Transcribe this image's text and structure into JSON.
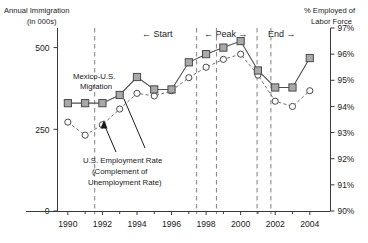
{
  "chart_data": {
    "type": "line",
    "title": "",
    "xlabel": "",
    "x": [
      1990,
      1991,
      1992,
      1993,
      1994,
      1995,
      1996,
      1997,
      1998,
      1999,
      2000,
      2001,
      2002,
      2003,
      2004
    ],
    "xlim": [
      1989.4,
      2005.2
    ],
    "xticks": [
      1990,
      1992,
      1994,
      1996,
      1998,
      2000,
      2002,
      2004
    ],
    "xtick_labels": [
      "1990",
      "1992",
      "1994",
      "1996",
      "1998",
      "2000",
      "2002",
      "2004"
    ],
    "xminor_ticks": [
      1991,
      1993,
      1995,
      1997,
      1999,
      2001,
      2003
    ],
    "grid": false,
    "legend_position": "inline-annotations",
    "left_axis": {
      "title_line1": "Annual Immigration",
      "title_line2": "(in 000s)",
      "ylim": [
        0,
        560
      ],
      "yticks": [
        0,
        250,
        500
      ],
      "ytick_labels": [
        "0",
        "250",
        "500"
      ]
    },
    "right_axis": {
      "title_line1": "% Employed of",
      "title_line2": "Labor Force",
      "ylim": [
        90,
        97
      ],
      "yticks": [
        90,
        91,
        92,
        93,
        94,
        95,
        96,
        97
      ],
      "ytick_labels": [
        "90%",
        "91%",
        "92%",
        "93%",
        "94%",
        "95%",
        "96%",
        "97%"
      ]
    },
    "series": [
      {
        "name": "Mexico-U.S. Migration",
        "axis": "left",
        "marker": "square",
        "linestyle": "solid",
        "color": "#a9a9a9",
        "values": [
          330,
          330,
          330,
          355,
          410,
          372,
          372,
          455,
          480,
          500,
          520,
          430,
          378,
          378,
          468
        ]
      },
      {
        "name": "U.S. Employment Rate (Complement of Unemployment Rate)",
        "axis": "right",
        "marker": "circle",
        "linestyle": "dashed",
        "color": "#ffffff",
        "values": [
          93.4,
          92.9,
          93.3,
          93.9,
          94.5,
          94.4,
          94.6,
          95.1,
          95.5,
          95.8,
          96.0,
          95.2,
          94.2,
          94.0,
          94.6
        ]
      }
    ],
    "annotations": [
      {
        "name": "series-label-migration",
        "line1": "Mexico-U.S.",
        "line2": "Migration"
      },
      {
        "name": "series-label-employment",
        "line1": "U.S. Employment Rate",
        "line2": "(Complement of",
        "line3": "Unemployment Rate)"
      }
    ],
    "reference_lines": [
      {
        "name": "ref-line-1",
        "x": 1991.55
      },
      {
        "name": "ref-line-2",
        "x": 1997.45
      },
      {
        "name": "ref-line-3",
        "x": 1998.6
      },
      {
        "name": "ref-line-4",
        "x": 2000.95
      },
      {
        "name": "ref-line-5",
        "x": 2001.75
      }
    ],
    "phase_labels": [
      {
        "name": "phase-start",
        "text": "← Start"
      },
      {
        "name": "phase-peak",
        "text": "← Peak →"
      },
      {
        "name": "phase-end",
        "text": "End →"
      }
    ]
  }
}
